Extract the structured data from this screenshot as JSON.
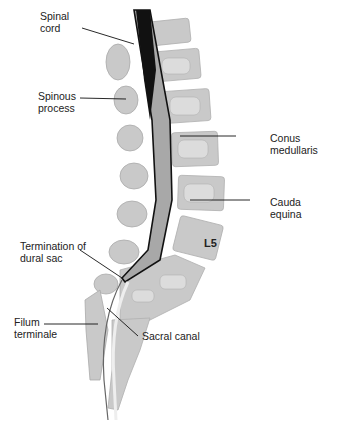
{
  "figure": {
    "type": "anatomical-diagram",
    "colors": {
      "bone": "#c9c9c9",
      "bone_dark": "#b3b3b3",
      "disc": "#ffffff",
      "cord_dark": "#111111",
      "dural_sac": "#a8a8a8",
      "outline": "#111111"
    },
    "labels": {
      "spinal_cord": "Spinal\ncord",
      "spinous_process": "Spinous\nprocess",
      "conus_medullaris": "Conus\nmedullaris",
      "cauda_equina": "Cauda\nequina",
      "l5": "L5",
      "termination_dural_sac": "Termination of\ndural sac",
      "filum_terminale": "Filum\nterminale",
      "sacral_canal": "Sacral canal"
    }
  }
}
